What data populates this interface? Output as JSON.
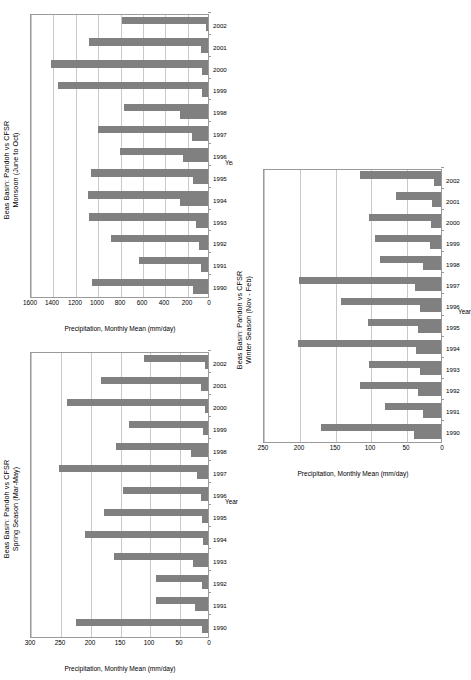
{
  "page": {
    "background": "#ffffff",
    "bar_color": "#808080",
    "grid_color": "#c9c9c9",
    "axis_color": "#9a9a9a"
  },
  "charts": [
    {
      "id": "monsoon",
      "title_line1": "Beas Basin: Pandoh vs CFSR",
      "title_line2": "Monsoon (June to Oct)",
      "legend": [
        "Pandoh",
        "CFSR"
      ],
      "xlabel": "Year",
      "ylabel": "Precipitation, Monthly Mean (mm/day)",
      "yticks": [
        "0",
        "200",
        "400",
        "600",
        "800",
        "1000",
        "1200",
        "1400",
        "1600"
      ],
      "chart_data": {
        "type": "bar",
        "title": "Beas Basin: Pandoh vs CFSR  Monsoon (June to Oct)",
        "xlabel": "Year",
        "ylabel": "Precipitation, Monthly Mean (mm/day)",
        "ylim": [
          0,
          1600
        ],
        "grid": true,
        "legend_position": "top-left",
        "categories": [
          "1990",
          "1991",
          "1992",
          "1993",
          "1994",
          "1995",
          "1996",
          "1997",
          "1998",
          "1999",
          "2000",
          "2001",
          "2002"
        ],
        "series": [
          {
            "name": "Pandoh",
            "values": [
              130,
              60,
              85,
              110,
              250,
              130,
              220,
              140,
              250,
              55,
              50,
              65,
              20
            ]
          },
          {
            "name": "CFSR",
            "values": [
              1040,
              620,
              870,
              1060,
              1070,
              1050,
              790,
              980,
              750,
              1340,
              1400,
              1060,
              770
            ]
          }
        ]
      }
    },
    {
      "id": "spring",
      "title_line1": "Beas Basin: Pandoh vs CFSR",
      "title_line2": "Spring Season (Mar-May)",
      "legend": [
        "Pandoh",
        "CFSR"
      ],
      "xlabel": "Year",
      "ylabel": "Precipitation, Monthly Mean (mm/day)",
      "yticks": [
        "0",
        "50",
        "100",
        "150",
        "200",
        "250",
        "300"
      ],
      "chart_data": {
        "type": "bar",
        "title": "Beas Basin: Pandoh vs CFSR  Spring Season (Mar-May)",
        "xlabel": "Year",
        "ylabel": "Precipitation, Monthly Mean (mm/day)",
        "ylim": [
          0,
          300
        ],
        "grid": true,
        "legend_position": "top-left",
        "categories": [
          "1990",
          "1991",
          "1992",
          "1993",
          "1994",
          "1995",
          "1996",
          "1997",
          "1998",
          "1999",
          "2000",
          "2001",
          "2002"
        ],
        "series": [
          {
            "name": "Pandoh",
            "values": [
              10,
              22,
              10,
              25,
              8,
              10,
              12,
              18,
              28,
              8,
              5,
              12,
              5
            ]
          },
          {
            "name": "CFSR",
            "values": [
              222,
              88,
              87,
              157,
              207,
              175,
              143,
              250,
              155,
              132,
              236,
              180,
              108
            ]
          }
        ]
      }
    },
    {
      "id": "winter",
      "title_line1": "Beas Basin: Pandoh vs CFSR",
      "title_line2": "Winter Season (Nov - Feb)",
      "legend": [
        "Pandoh",
        "CFSR"
      ],
      "xlabel": "Year",
      "ylabel": "Precipitation, Monthly Mean (mm/day)",
      "yticks": [
        "0",
        "50",
        "100",
        "150",
        "200",
        "250"
      ],
      "chart_data": {
        "type": "bar",
        "title": "Beas Basin: Pandoh vs CFSR  Winter Season (Nov - Feb)",
        "xlabel": "Year",
        "ylabel": "Precipitation, Monthly Mean (mm/day)",
        "ylim": [
          0,
          250
        ],
        "grid": true,
        "legend_position": "top-left",
        "categories": [
          "1990",
          "1991",
          "1992",
          "1993",
          "1994",
          "1995",
          "1996",
          "1997",
          "1998",
          "1999",
          "2000",
          "2001",
          "2002"
        ],
        "series": [
          {
            "name": "Pandoh",
            "values": [
              38,
              25,
              32,
              30,
              35,
              32,
              30,
              36,
              25,
              15,
              14,
              12,
              10
            ]
          },
          {
            "name": "CFSR",
            "values": [
              168,
              78,
              113,
              100,
              200,
              102,
              140,
              199,
              85,
              92,
              100,
              63,
              113
            ]
          }
        ]
      }
    }
  ]
}
